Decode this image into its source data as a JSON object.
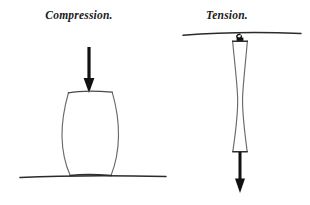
{
  "figure": {
    "background_color": "#ffffff",
    "ink_color": "#1a1a1a",
    "outline_color": "#5a5a5a",
    "width": 310,
    "height": 205
  },
  "panels": [
    {
      "id": "compression",
      "label": "Compression.",
      "label_x": 79,
      "label_y": 19,
      "load_arrow": {
        "name": "downward-load-arrow",
        "direction": "down",
        "x": 89,
        "y_start": 47,
        "y_end": 92,
        "shaft_width": 3.2,
        "head_width": 11,
        "head_length": 10
      },
      "specimen": {
        "name": "barrel-column",
        "deformation": "bulging",
        "top_y": 92,
        "bottom_y": 176,
        "top_left_x": 68,
        "top_right_x": 112,
        "mid_left_x": 61.5,
        "mid_right_x": 118.5,
        "bottom_left_x": 70,
        "bottom_right_x": 111
      },
      "support": {
        "name": "ground-line",
        "type": "ground",
        "x_start": 20,
        "x_end": 166,
        "y": 176
      }
    },
    {
      "id": "tension",
      "label": "Tension.",
      "label_x": 227,
      "label_y": 19,
      "load_arrow": {
        "name": "downward-pull-arrow",
        "direction": "down",
        "x": 240,
        "y_start": 152,
        "y_end": 193,
        "shaft_width": 3.0,
        "head_width": 10,
        "head_length": 10
      },
      "specimen": {
        "name": "necked-bar",
        "deformation": "necking",
        "top_y": 41,
        "bottom_y": 152,
        "top_left_x": 232.5,
        "top_right_x": 247.5,
        "neck_left_x": 237.5,
        "neck_right_x": 242.5,
        "bottom_left_x": 232.5,
        "bottom_right_x": 247.5
      },
      "support": {
        "name": "ceiling-line",
        "type": "ceiling",
        "x_start": 183,
        "x_end": 301,
        "y": 33
      },
      "attachment": {
        "name": "hook-clamp",
        "x": 240,
        "y": 37
      }
    }
  ]
}
